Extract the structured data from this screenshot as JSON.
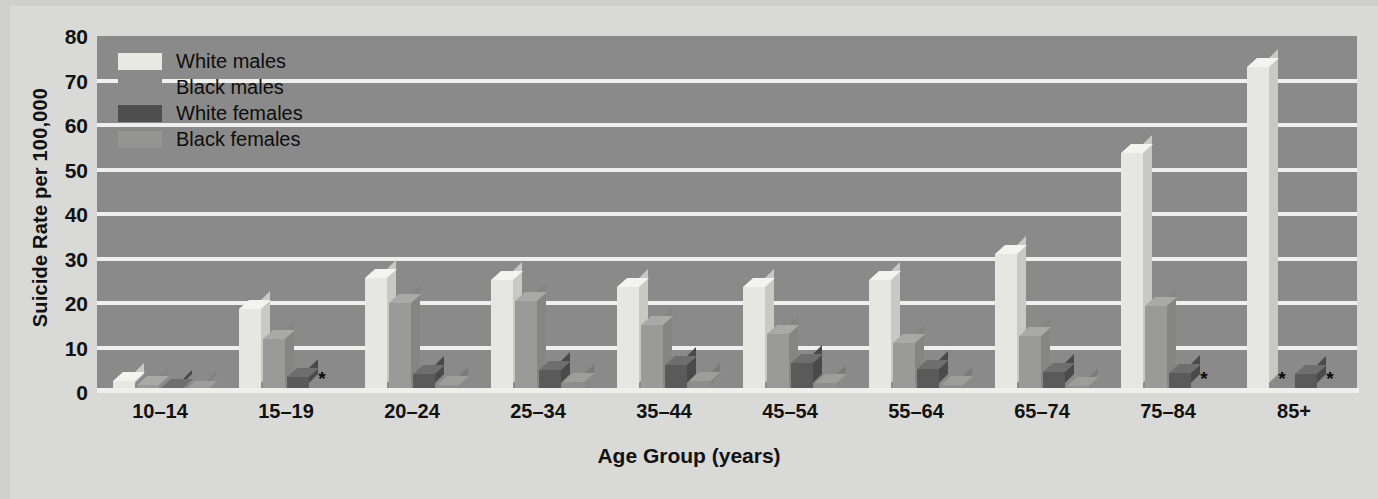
{
  "chart_data": {
    "type": "bar",
    "title": "",
    "xlabel": "Age Group (years)",
    "ylabel": "Suicide Rate per 100,000",
    "ylim": [
      0,
      80
    ],
    "yticks": [
      0,
      10,
      20,
      30,
      40,
      50,
      60,
      70,
      80
    ],
    "ytick_labels": [
      "0",
      "10",
      "20",
      "30",
      "40",
      "50",
      "60",
      "70",
      "80"
    ],
    "grid": true,
    "legend_position": "top-left",
    "categories": [
      "10–14",
      "15–19",
      "20–24",
      "25–34",
      "35–44",
      "45–54",
      "55–64",
      "65–74",
      "75–84",
      "85+"
    ],
    "series": [
      {
        "name": "White males",
        "key": "wm",
        "color": "#e6e6e2",
        "values": [
          2.5,
          18.6,
          25.6,
          25.2,
          23.5,
          23.6,
          25.1,
          31.0,
          53.8,
          73.0
        ],
        "suppressed": [
          false,
          false,
          false,
          false,
          false,
          false,
          false,
          false,
          false,
          false
        ]
      },
      {
        "name": "Black males",
        "key": "bm",
        "color": "#8a8a8a",
        "values": [
          1.6,
          12.0,
          20.0,
          20.5,
          15.0,
          13.0,
          11.0,
          12.5,
          19.4,
          null
        ],
        "suppressed": [
          false,
          false,
          false,
          false,
          false,
          false,
          false,
          false,
          false,
          true
        ]
      },
      {
        "name": "White females",
        "key": "wf",
        "color": "#5a5a5a",
        "values": [
          0.8,
          3.4,
          4.0,
          5.0,
          6.0,
          6.6,
          5.2,
          4.6,
          4.2,
          4.0
        ],
        "suppressed": [
          false,
          false,
          false,
          false,
          false,
          false,
          false,
          false,
          false,
          false
        ]
      },
      {
        "name": "Black females",
        "key": "bf",
        "color": "#949493",
        "values": [
          0.4,
          null,
          1.6,
          2.2,
          2.4,
          2.0,
          1.6,
          1.4,
          null,
          null
        ],
        "suppressed": [
          false,
          true,
          false,
          false,
          false,
          false,
          false,
          false,
          true,
          true
        ]
      }
    ],
    "suppressed_marker": "*",
    "note": "Asterisk marks rates suppressed / not shown"
  },
  "legend": {
    "items": [
      {
        "label": "White males",
        "swatch": "sw-wm",
        "has_swatch": true
      },
      {
        "label": "Black males",
        "swatch": "sw-bm",
        "has_swatch": true
      },
      {
        "label": "White females",
        "swatch": "sw-wf",
        "has_swatch": true
      },
      {
        "label": "Black females",
        "swatch": "sw-bf",
        "has_swatch": true
      }
    ]
  }
}
